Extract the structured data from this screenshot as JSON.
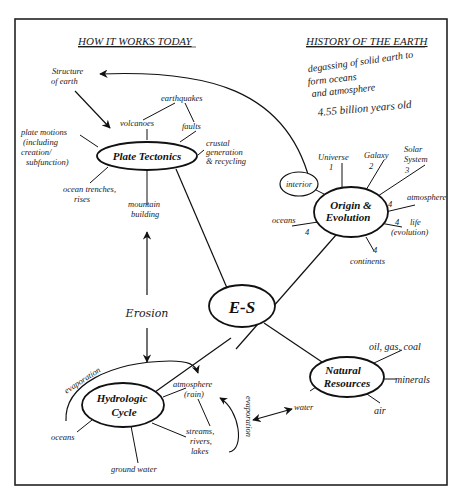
{
  "headers": {
    "left": "HOW IT WORKS TODAY",
    "right": "HISTORY OF THE EARTH"
  },
  "history_notes": {
    "line1": "degassing of solid earth  to",
    "line2": "form oceans",
    "line3": "and atmosphere",
    "age": "4.55 billion years old"
  },
  "center": {
    "label": "E-S"
  },
  "plate_tectonics": {
    "label": "Plate Tectonics",
    "structure": [
      "Structure",
      "of  earth"
    ],
    "earthquakes": "earthquakes",
    "volcanoes": "volcanoes",
    "faults": "faults",
    "crustal": [
      "crustal",
      "generation",
      "& recycling"
    ],
    "plate_motions": [
      "plate motions",
      "(including",
      "creation/",
      "subfunction)"
    ],
    "trenches": [
      "ocean trenches,",
      "rises"
    ],
    "mountain": [
      "mountain",
      "building"
    ]
  },
  "erosion": {
    "label": "Erosion"
  },
  "origin": {
    "label1": "Origin  &",
    "label2": "Evolution",
    "interior": "interior",
    "universe": [
      "Universe",
      "1"
    ],
    "galaxy": [
      "Galaxy",
      "2"
    ],
    "solar": [
      "Solar",
      "System",
      "3"
    ],
    "atmosphere": [
      "4",
      "atmosphere"
    ],
    "life": [
      "4",
      "life",
      "(evolution)"
    ],
    "oceans": [
      "oceans",
      "4"
    ],
    "continents": [
      "4",
      "continents"
    ]
  },
  "hydrologic": {
    "label1": "Hydrologic",
    "label2": "Cycle",
    "evaporation_left": "evaporation",
    "atmosphere": [
      "atmosphere",
      "(rain)"
    ],
    "streams": [
      "streams,",
      "rivers,",
      "lakes"
    ],
    "oceans": "oceans",
    "ground_water": "ground water",
    "evaporation_right": "evaporation"
  },
  "natural_resources": {
    "label1": "Natural",
    "label2": "Resources",
    "oil": "oil, gas, coal",
    "minerals": "minerals",
    "air": "air",
    "water": "water"
  }
}
